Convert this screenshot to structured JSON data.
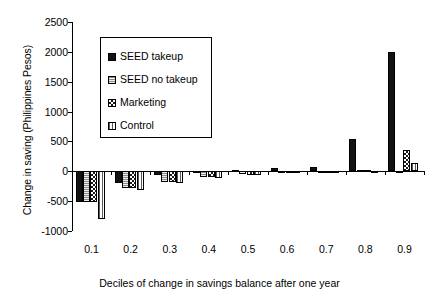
{
  "chart_data": {
    "type": "bar",
    "title": "",
    "xlabel": "Deciles of change in savings balance after one year",
    "ylabel": "Change in saving (Philippines Pesos)",
    "categories": [
      "0.1",
      "0.2",
      "0.3",
      "0.4",
      "0.5",
      "0.6",
      "0.7",
      "0.8",
      "0.9"
    ],
    "ylim": [
      -1000,
      2500
    ],
    "yticks": [
      2500,
      2000,
      1500,
      1000,
      500,
      0,
      -500,
      -1000
    ],
    "ytick_labels": [
      "2500",
      "2000",
      "1500",
      "1000",
      "500",
      "0",
      "-500",
      "-1000"
    ],
    "grid": false,
    "legend_position": "upper-left-inside",
    "series": [
      {
        "name": "SEED takeup",
        "pattern": "solid-black",
        "color": "#121212",
        "values": [
          -510,
          -195,
          -65,
          -25,
          20,
          50,
          65,
          540,
          2005
        ]
      },
      {
        "name": "SEED no takeup",
        "pattern": "fine-horizontal-dots",
        "color": "#8a8a8a",
        "values": [
          -510,
          -285,
          -180,
          -95,
          -40,
          -10,
          0,
          15,
          0
        ]
      },
      {
        "name": "Marketing",
        "pattern": "checkerboard",
        "color": "#1a1a1a",
        "values": [
          -515,
          -280,
          -180,
          -95,
          -55,
          -15,
          0,
          20,
          350
        ]
      },
      {
        "name": "Control",
        "pattern": "light-vertical-lines",
        "color": "#5a5a5a",
        "values": [
          -800,
          -320,
          -200,
          -110,
          -60,
          0,
          0,
          0,
          145
        ]
      }
    ]
  },
  "legend": {
    "items": [
      {
        "label": "SEED takeup"
      },
      {
        "label": "SEED no takeup"
      },
      {
        "label": "Marketing"
      },
      {
        "label": "Control"
      }
    ]
  },
  "axes": {
    "y_title": "Change in saving (Philippines Pesos)",
    "x_title": "Deciles of change in savings balance after one year"
  }
}
